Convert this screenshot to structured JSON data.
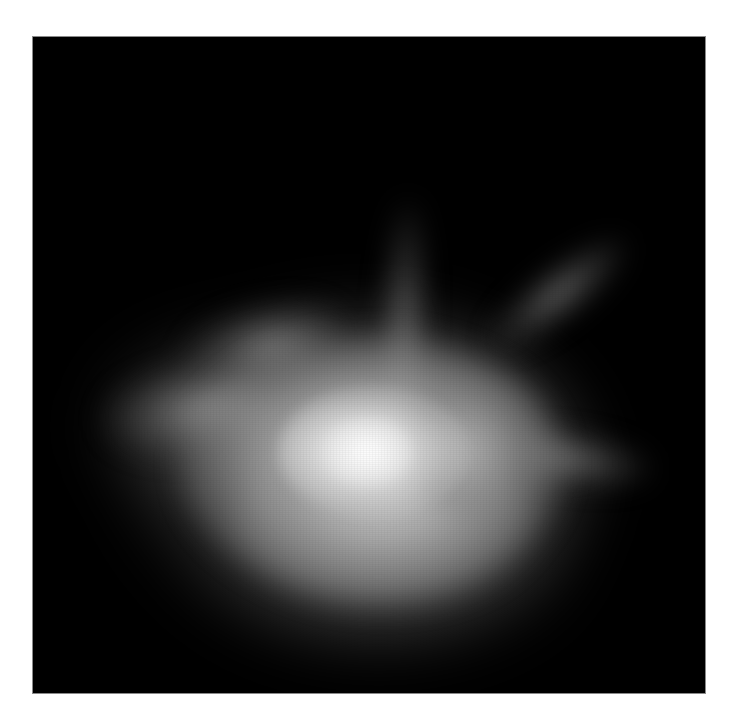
{
  "image": {
    "description": "Grayscale fluorescence micrograph of a single cell with diffuse bright body and thin projections",
    "background_color": "#000000",
    "margin_color": "#ffffff",
    "frame": {
      "x": 33,
      "y": 37,
      "width": 672,
      "height": 656
    },
    "subject": {
      "type": "cell",
      "brightest_point": {
        "x": 360,
        "y": 445
      },
      "core_color": "#f2f2f2",
      "projections": [
        {
          "name": "top",
          "tip": {
            "x": 405,
            "y": 205
          }
        },
        {
          "name": "upper-right",
          "tip": {
            "x": 620,
            "y": 300
          }
        },
        {
          "name": "right",
          "tip": {
            "x": 640,
            "y": 465
          }
        },
        {
          "name": "left",
          "tip": {
            "x": 115,
            "y": 405
          }
        }
      ]
    }
  }
}
